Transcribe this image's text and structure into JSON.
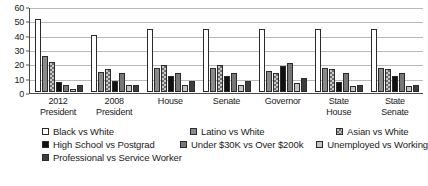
{
  "chart_data": {
    "type": "bar",
    "title": "",
    "xlabel": "",
    "ylabel": "",
    "ylim": [
      0,
      60
    ],
    "yticks": [
      0,
      10,
      20,
      30,
      40,
      50,
      60
    ],
    "grid": true,
    "legend_position": "bottom",
    "categories": [
      "2012 President",
      "2008 President",
      "House",
      "Senate",
      "Governor",
      "State House",
      "State Senate"
    ],
    "category_lines": [
      [
        "2012",
        "President"
      ],
      [
        "2008",
        "President"
      ],
      [
        "House",
        ""
      ],
      [
        "Senate",
        ""
      ],
      [
        "Governor",
        ""
      ],
      [
        "State",
        "House"
      ],
      [
        "State",
        "Senate"
      ]
    ],
    "series": [
      {
        "name": "Black vs White",
        "values": [
          51,
          40,
          44,
          44,
          44,
          44,
          44
        ]
      },
      {
        "name": "Latino vs White",
        "values": [
          25,
          14,
          17,
          17,
          15,
          17,
          17
        ]
      },
      {
        "name": "Asian vs White",
        "values": [
          21,
          16,
          19,
          19,
          13,
          16,
          16
        ]
      },
      {
        "name": "High School vs Postgrad",
        "values": [
          7,
          8,
          11,
          11,
          18,
          7,
          11
        ]
      },
      {
        "name": "Under $30K vs Over $200k",
        "values": [
          5,
          13,
          13,
          13,
          20,
          13,
          13
        ]
      },
      {
        "name": "Unemployed vs Working",
        "values": [
          2,
          5,
          5,
          5,
          6,
          4,
          4
        ]
      },
      {
        "name": "Professional vs Service Worker",
        "values": [
          5,
          5,
          8,
          8,
          10,
          5,
          5
        ]
      }
    ]
  },
  "legend": {
    "rows": [
      [
        {
          "label": "Black vs White",
          "series": 0
        },
        {
          "label": "Latino vs White",
          "series": 1
        },
        {
          "label": "Asian vs White",
          "series": 2
        }
      ],
      [
        {
          "label": "High School vs Postgrad",
          "series": 3
        },
        {
          "label": "Under $30K vs Over $200k",
          "series": 4
        },
        {
          "label": "Unemployed vs Working",
          "series": 5
        }
      ],
      [
        {
          "label": "Professional vs Service Worker",
          "series": 6
        }
      ]
    ]
  },
  "colors": {
    "axis": "#4a4a4a",
    "grid": "#b9b9b9",
    "text": "#1a1a1a",
    "background": "#ffffff"
  }
}
